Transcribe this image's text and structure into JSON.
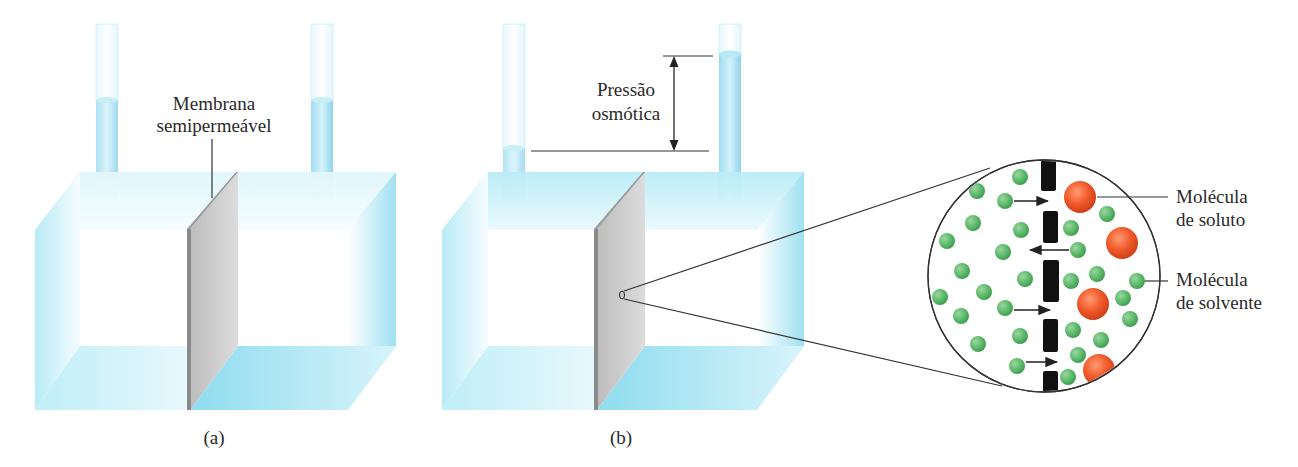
{
  "figure": {
    "panel_a": {
      "caption": "(a)",
      "membrane_label_line1": "Membrana",
      "membrane_label_line2": "semipermeável"
    },
    "panel_b": {
      "caption": "(b)",
      "pressure_label_line1": "Pressão",
      "pressure_label_line2": "osmótica"
    },
    "magnified_view": {
      "solute_label_line1": "Molécula",
      "solute_label_line2": "de soluto",
      "solvent_label_line1": "Molécula",
      "solvent_label_line2": "de solvente"
    },
    "colors": {
      "water": "#aee6f3",
      "water_dark": "#7fd3ea",
      "membrane": "#c8c8c8",
      "membrane_edge": "#8a8a8a",
      "solvent_molecule": "#5cb86a",
      "solute_molecule": "#f0582a",
      "pore_wall": "#111111"
    }
  }
}
